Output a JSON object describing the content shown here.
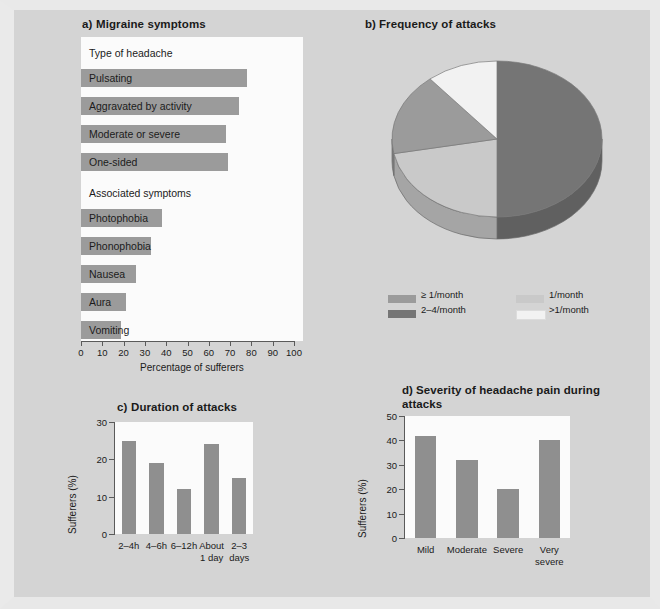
{
  "figure": {
    "background_color": "#d4d4d4",
    "plot_background_color": "#fbfbfb",
    "bar_color": "#9b9b9b"
  },
  "chart_data": [
    {
      "id": "a",
      "type": "bar",
      "orientation": "horizontal",
      "title": "a)  Migraine symptoms",
      "panel_letter": "a)",
      "panel_name": "Migraine symptoms",
      "xlabel": "Percentage of sufferers",
      "ylabel": "",
      "xlim": [
        0,
        100
      ],
      "xticks": [
        0,
        10,
        20,
        30,
        40,
        50,
        60,
        70,
        80,
        90,
        100
      ],
      "grid": false,
      "groups": [
        {
          "heading": "Type of headache",
          "categories": [
            "Pulsating",
            "Aggravated by activity",
            "Moderate or severe",
            "One-sided"
          ],
          "values": [
            78,
            74,
            68,
            69
          ]
        },
        {
          "heading": "Associated symptoms",
          "categories": [
            "Photophobia",
            "Phonophobia",
            "Nausea",
            "Aura",
            "Vomiting"
          ],
          "values": [
            38,
            33,
            26,
            21,
            19
          ]
        }
      ]
    },
    {
      "id": "b",
      "type": "pie",
      "title": "b)  Frequency of attacks",
      "panel_letter": "b)",
      "panel_name": "Frequency of attacks",
      "labels": [
        "≥ 1/month",
        "1/month",
        "2–4/month",
        ">1/month"
      ],
      "values": [
        50,
        22,
        17,
        11
      ],
      "colors": [
        "#757575",
        "#c9c9c9",
        "#9b9b9b",
        "#f2f2f2"
      ],
      "legend": {
        "position": "bottom",
        "entries": [
          {
            "label": "≥ 1/month",
            "color": "#9b9b9b"
          },
          {
            "label": "1/month",
            "color": "#c9c9c9"
          },
          {
            "label": "2–4/month",
            "color": "#757575"
          },
          {
            "label": ">1/month",
            "color": "#f2f2f2"
          }
        ]
      }
    },
    {
      "id": "c",
      "type": "bar",
      "orientation": "vertical",
      "title": "c)  Duration of attacks",
      "panel_letter": "c)",
      "panel_name": "Duration of attacks",
      "categories": [
        "2–4h",
        "4–6h",
        "6–12h",
        "About\n1 day",
        "2–3\ndays"
      ],
      "values": [
        25,
        19,
        12,
        24,
        15
      ],
      "xlabel": "",
      "ylabel": "Sufferers (%)",
      "ylim": [
        0,
        30
      ],
      "yticks": [
        0,
        10,
        20,
        30
      ],
      "grid": false
    },
    {
      "id": "d",
      "type": "bar",
      "orientation": "vertical",
      "title": "d)  Severity of headache pain during attacks",
      "panel_letter": "d)",
      "panel_name": "Severity of headache pain during attacks",
      "categories": [
        "Mild",
        "Moderate",
        "Severe",
        "Very\nsevere"
      ],
      "values": [
        42,
        32,
        20,
        40
      ],
      "xlabel": "",
      "ylabel": "Sufferers (%)",
      "ylim": [
        0,
        50
      ],
      "yticks": [
        0,
        10,
        20,
        30,
        40,
        50
      ],
      "grid": false
    }
  ]
}
